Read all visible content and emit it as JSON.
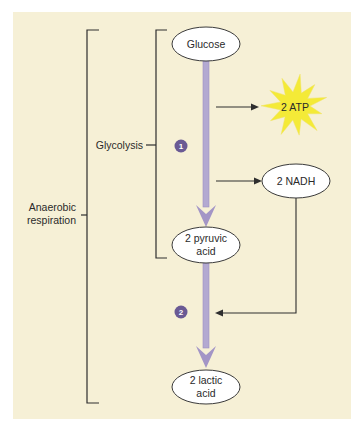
{
  "diagram": {
    "colors": {
      "panel": "#f6f0d6",
      "arrow": "#b3a9d1",
      "arrow_dark": "#9d8fc2",
      "badge": "#6a5a94",
      "star": "#f4ea37",
      "line": "#2e2e2e"
    },
    "nodes": {
      "glucose": "Glucose",
      "pyruvic_line1": "2 pyruvic",
      "pyruvic_line2": "acid",
      "lactic_line1": "2 lactic",
      "lactic_line2": "acid",
      "atp": "2 ATP",
      "nadh": "2 NADH"
    },
    "brackets": {
      "glycolysis": "Glycolysis",
      "anaerobic_line1": "Anaerobic",
      "anaerobic_line2": "respiration"
    },
    "steps": [
      "1",
      "2"
    ]
  }
}
